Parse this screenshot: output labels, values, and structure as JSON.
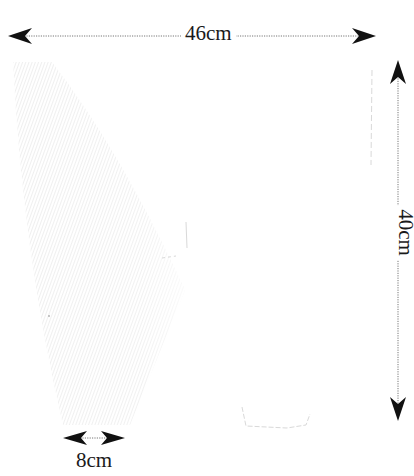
{
  "diagram": {
    "type": "dimensioned-pattern-sketch",
    "dimensions": {
      "width": {
        "label": "46cm",
        "orientation": "horizontal",
        "position": "top"
      },
      "height": {
        "label": "40cm",
        "orientation": "vertical",
        "position": "right"
      },
      "bottom_width": {
        "label": "8cm",
        "orientation": "horizontal",
        "position": "bottom-left"
      }
    },
    "colors": {
      "arrow": "#111111",
      "dotted_line": "#777777",
      "hatch": "#e4e4e4",
      "faint_trace": "#d8d8d8",
      "background": "#ffffff"
    }
  }
}
